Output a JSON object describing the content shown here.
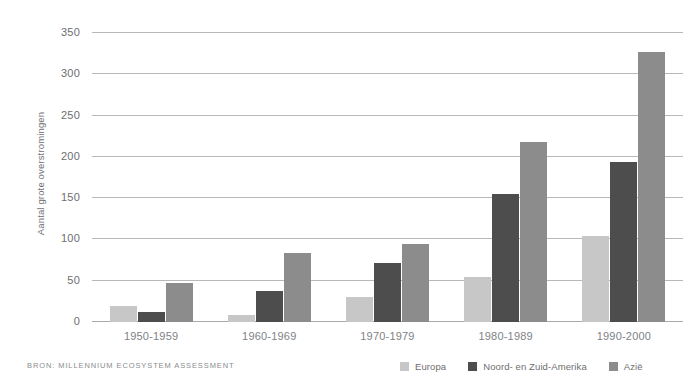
{
  "chart_data": {
    "type": "bar",
    "title": "",
    "xlabel": "",
    "ylabel": "Aantal grote overstromingen",
    "categories": [
      "1950-1959",
      "1960-1969",
      "1970-1979",
      "1980-1989",
      "1990-2000"
    ],
    "series": [
      {
        "name": "Europa",
        "color": "#c7c7c7",
        "values": [
          20,
          9,
          30,
          54,
          104
        ]
      },
      {
        "name": "Noord- en Zuid-Amerika",
        "color": "#4d4d4d",
        "values": [
          12,
          37,
          72,
          155,
          194
        ]
      },
      {
        "name": "Azië",
        "color": "#8c8c8c",
        "values": [
          47,
          83,
          94,
          218,
          327
        ]
      }
    ],
    "ylim": [
      0,
      350
    ],
    "yticks": [
      0,
      50,
      100,
      150,
      200,
      250,
      300,
      350
    ],
    "ytick_labels": [
      "0",
      "50",
      "100",
      "150",
      "200",
      "250",
      "300",
      "350"
    ],
    "grid": true,
    "legend_position": "bottom-right"
  },
  "footer": {
    "source": "BRON: MILLENNIUM ECOSYSTEM ASSESSMENT"
  }
}
